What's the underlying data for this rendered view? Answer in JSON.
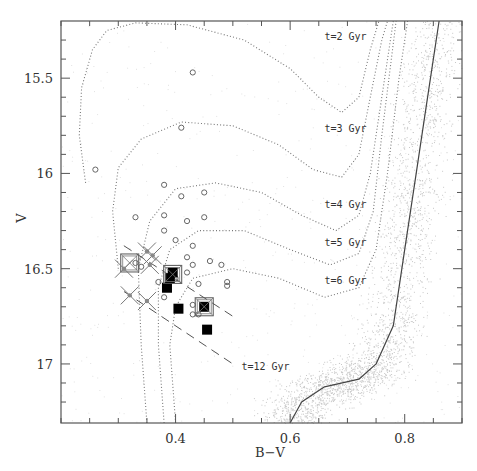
{
  "chart_data": {
    "type": "scatter",
    "title": "",
    "xlabel": "B−V",
    "ylabel": "V",
    "xlim": [
      0.2,
      0.9
    ],
    "ylim": [
      17.31,
      15.2
    ],
    "y_inverted": true,
    "grid": false,
    "x_ticks": [
      0.4,
      0.6,
      0.8
    ],
    "y_ticks": [
      15.5,
      16,
      16.5,
      17
    ],
    "x_minor_step": 0.05,
    "y_minor_step": 0.1,
    "annotations": [
      {
        "text": "t=2 Gyr",
        "x": 0.66,
        "y": 15.3
      },
      {
        "text": "t=3 Gyr",
        "x": 0.66,
        "y": 15.78
      },
      {
        "text": "t=4 Gyr",
        "x": 0.66,
        "y": 16.18
      },
      {
        "text": "t=5 Gyr",
        "x": 0.66,
        "y": 16.38
      },
      {
        "text": "t=6 Gyr",
        "x": 0.66,
        "y": 16.58
      },
      {
        "text": "t=12 Gyr",
        "x": 0.515,
        "y": 17.03
      }
    ],
    "series": [
      {
        "name": "isochrone t=2 Gyr",
        "style": "dotted",
        "points": [
          [
            0.243,
            16.05
          ],
          [
            0.232,
            15.8
          ],
          [
            0.236,
            15.55
          ],
          [
            0.255,
            15.35
          ],
          [
            0.28,
            15.25
          ],
          [
            0.33,
            15.21
          ],
          [
            0.42,
            15.22
          ],
          [
            0.52,
            15.3
          ],
          [
            0.6,
            15.45
          ],
          [
            0.65,
            15.6
          ],
          [
            0.69,
            15.68
          ],
          [
            0.72,
            15.6
          ],
          [
            0.74,
            15.35
          ],
          [
            0.755,
            15.2
          ]
        ]
      },
      {
        "name": "isochrone t=3 Gyr",
        "style": "dotted",
        "points": [
          [
            0.3,
            16.5
          ],
          [
            0.29,
            16.2
          ],
          [
            0.3,
            15.97
          ],
          [
            0.34,
            15.82
          ],
          [
            0.41,
            15.73
          ],
          [
            0.5,
            15.75
          ],
          [
            0.58,
            15.85
          ],
          [
            0.64,
            15.98
          ],
          [
            0.69,
            16.02
          ],
          [
            0.72,
            15.9
          ],
          [
            0.74,
            15.6
          ],
          [
            0.76,
            15.3
          ],
          [
            0.77,
            15.2
          ]
        ]
      },
      {
        "name": "isochrone t=4 Gyr",
        "style": "dotted",
        "points": [
          [
            0.35,
            17.31
          ],
          [
            0.34,
            16.9
          ],
          [
            0.335,
            16.5
          ],
          [
            0.355,
            16.25
          ],
          [
            0.4,
            16.08
          ],
          [
            0.47,
            16.05
          ],
          [
            0.55,
            16.1
          ],
          [
            0.62,
            16.22
          ],
          [
            0.68,
            16.3
          ],
          [
            0.72,
            16.22
          ],
          [
            0.74,
            16.0
          ],
          [
            0.76,
            15.6
          ],
          [
            0.78,
            15.2
          ]
        ]
      },
      {
        "name": "isochrone t=5 Gyr",
        "style": "dotted",
        "points": [
          [
            0.38,
            17.31
          ],
          [
            0.37,
            16.9
          ],
          [
            0.37,
            16.6
          ],
          [
            0.39,
            16.4
          ],
          [
            0.44,
            16.3
          ],
          [
            0.52,
            16.3
          ],
          [
            0.6,
            16.4
          ],
          [
            0.67,
            16.48
          ],
          [
            0.72,
            16.42
          ],
          [
            0.745,
            16.2
          ],
          [
            0.76,
            15.8
          ],
          [
            0.785,
            15.2
          ]
        ]
      },
      {
        "name": "isochrone t=6 Gyr",
        "style": "dotted",
        "points": [
          [
            0.4,
            17.31
          ],
          [
            0.39,
            16.9
          ],
          [
            0.4,
            16.7
          ],
          [
            0.43,
            16.55
          ],
          [
            0.5,
            16.5
          ],
          [
            0.58,
            16.55
          ],
          [
            0.66,
            16.65
          ],
          [
            0.72,
            16.6
          ],
          [
            0.75,
            16.4
          ],
          [
            0.77,
            16.0
          ],
          [
            0.79,
            15.5
          ],
          [
            0.805,
            15.2
          ]
        ]
      },
      {
        "name": "isochrone t=12 Gyr",
        "style": "solid",
        "points": [
          [
            0.6,
            17.31
          ],
          [
            0.62,
            17.2
          ],
          [
            0.66,
            17.12
          ],
          [
            0.72,
            17.08
          ],
          [
            0.75,
            17.0
          ],
          [
            0.78,
            16.8
          ],
          [
            0.8,
            16.4
          ],
          [
            0.82,
            16.0
          ],
          [
            0.84,
            15.6
          ],
          [
            0.86,
            15.2
          ]
        ]
      },
      {
        "name": "blue stragglers (open circles)",
        "marker": "circle",
        "points": [
          [
            0.26,
            15.98
          ],
          [
            0.43,
            15.47
          ],
          [
            0.41,
            15.76
          ],
          [
            0.38,
            16.06
          ],
          [
            0.41,
            16.12
          ],
          [
            0.45,
            16.1
          ],
          [
            0.38,
            16.22
          ],
          [
            0.42,
            16.25
          ],
          [
            0.45,
            16.23
          ],
          [
            0.33,
            16.23
          ],
          [
            0.38,
            16.3
          ],
          [
            0.4,
            16.35
          ],
          [
            0.43,
            16.38
          ],
          [
            0.42,
            16.44
          ],
          [
            0.43,
            16.48
          ],
          [
            0.46,
            16.46
          ],
          [
            0.48,
            16.48
          ],
          [
            0.49,
            16.57
          ],
          [
            0.49,
            16.59
          ],
          [
            0.42,
            16.52
          ],
          [
            0.4,
            16.55
          ],
          [
            0.44,
            16.58
          ],
          [
            0.37,
            16.57
          ],
          [
            0.38,
            16.65
          ],
          [
            0.43,
            16.69
          ],
          [
            0.44,
            16.74
          ],
          [
            0.43,
            16.74
          ],
          [
            0.33,
            16.47
          ],
          [
            0.34,
            16.49
          ]
        ]
      },
      {
        "name": "filled squares",
        "marker": "square-filled",
        "points": [
          [
            0.395,
            16.52
          ],
          [
            0.39,
            16.55
          ],
          [
            0.385,
            16.6
          ],
          [
            0.405,
            16.71
          ],
          [
            0.45,
            16.7
          ],
          [
            0.455,
            16.82
          ]
        ]
      },
      {
        "name": "open squares",
        "marker": "square-open",
        "points": [
          [
            0.32,
            16.47
          ],
          [
            0.395,
            16.53
          ],
          [
            0.45,
            16.7
          ]
        ]
      },
      {
        "name": "crosses",
        "marker": "x",
        "points": [
          [
            0.31,
            16.5
          ],
          [
            0.35,
            16.41
          ],
          [
            0.36,
            16.43
          ],
          [
            0.355,
            16.48
          ],
          [
            0.32,
            16.64
          ],
          [
            0.35,
            16.67
          ]
        ]
      },
      {
        "name": "selection band (dashed)",
        "style": "dashed",
        "lines": [
          [
            [
              0.31,
              16.38
            ],
            [
              0.5,
              16.75
            ]
          ],
          [
            [
              0.31,
              16.62
            ],
            [
              0.5,
              17.0
            ]
          ]
        ]
      }
    ],
    "background": "dense grey point cloud of cluster stars concentrated along t=12 Gyr isochrone"
  }
}
